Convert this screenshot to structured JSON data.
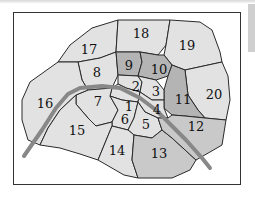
{
  "map": {
    "title": "Paris arrondissements",
    "colors": {
      "light": "#e2e2e2",
      "medium": "#c9c9c9",
      "dark": "#b4b4b4",
      "river": "#888888",
      "border": "#2a2a2a"
    },
    "river_label": "Seine",
    "arrondissements": [
      {
        "id": "1",
        "label": "1"
      },
      {
        "id": "2",
        "label": "2"
      },
      {
        "id": "3",
        "label": "3"
      },
      {
        "id": "4",
        "label": "4"
      },
      {
        "id": "5",
        "label": "5"
      },
      {
        "id": "6",
        "label": "6"
      },
      {
        "id": "7",
        "label": "7"
      },
      {
        "id": "8",
        "label": "8"
      },
      {
        "id": "9",
        "label": "9"
      },
      {
        "id": "10",
        "label": "10"
      },
      {
        "id": "11",
        "label": "11"
      },
      {
        "id": "12",
        "label": "12"
      },
      {
        "id": "13",
        "label": "13"
      },
      {
        "id": "14",
        "label": "14"
      },
      {
        "id": "15",
        "label": "15"
      },
      {
        "id": "16",
        "label": "16"
      },
      {
        "id": "17",
        "label": "17"
      },
      {
        "id": "18",
        "label": "18"
      },
      {
        "id": "19",
        "label": "19"
      },
      {
        "id": "20",
        "label": "20"
      }
    ]
  }
}
